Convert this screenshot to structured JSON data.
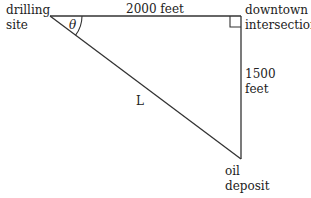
{
  "diagram": {
    "type": "right-triangle",
    "labels": {
      "drilling_site_line1": "drilling",
      "drilling_site_line2": "site",
      "top_side": "2000 feet",
      "downtown_line1": "downtown",
      "downtown_line2": "intersection",
      "right_side_line1": "1500",
      "right_side_line2": "feet",
      "hypotenuse": "L",
      "angle": "θ",
      "oil_line1": "oil",
      "oil_line2": "deposit"
    },
    "colors": {
      "line": "#333333",
      "text": "#222222"
    }
  }
}
